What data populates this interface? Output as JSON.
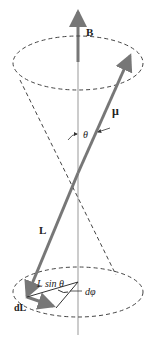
{
  "diagram": {
    "labels": {
      "field": "B",
      "moment": "μ",
      "angle": "θ",
      "angular_momentum": "L",
      "projection": "L sin θ",
      "d_phi": "dφ",
      "dL": "dL"
    },
    "colors": {
      "vector": "#777777",
      "axis": "#888888",
      "dashed": "#444444",
      "text": "#222222"
    }
  }
}
